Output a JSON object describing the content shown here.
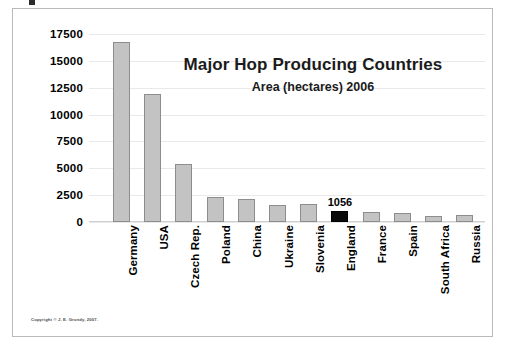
{
  "chart_data": {
    "type": "bar",
    "title": "Major Hop Producing Countries",
    "subtitle": "Area (hectares) 2006",
    "xlabel": "",
    "ylabel": "",
    "grid": true,
    "legend": "none",
    "ylim": [
      0,
      17500
    ],
    "yticks": [
      17500,
      15000,
      12500,
      10000,
      7500,
      5000,
      2500,
      0
    ],
    "categories": [
      "Germany",
      "USA",
      "Czech Rep.",
      "Poland",
      "China",
      "Ukraine",
      "Slovenia",
      "England",
      "France",
      "Spain",
      "South Africa",
      "Russia"
    ],
    "values": [
      16800,
      11950,
      5400,
      2350,
      2150,
      1600,
      1650,
      1056,
      950,
      800,
      600,
      650
    ],
    "highlight_category": "England",
    "annotations": [
      {
        "category": "England",
        "text": "1056"
      }
    ],
    "colors": {
      "bar_fill": "#c3c3c3",
      "bar_border": "#8d8d8d",
      "highlight_fill": "#0a0a0a",
      "gridline": "#e9e9e9",
      "frame": "#b9b9b9",
      "background": "#ffffff",
      "text": "#000000"
    }
  },
  "footer": {
    "copyright": "Copyright © J. E. Grundy,  2007."
  }
}
